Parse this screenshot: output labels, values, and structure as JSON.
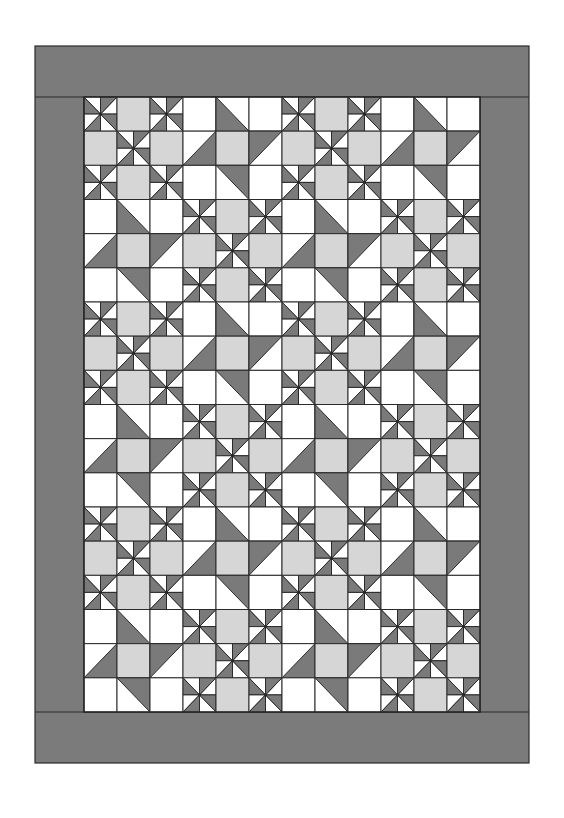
{
  "quilt": {
    "frame": {
      "x": 35,
      "y": 46,
      "width": 494,
      "height": 717
    },
    "interior": {
      "x": 84,
      "y": 97,
      "width": 396,
      "height": 615
    },
    "blocks_across": 4,
    "blocks_down": 6,
    "cells_per_block": 3,
    "block_arrangement": "checkerboard",
    "first_block": "pinwheel",
    "block_types": [
      "pinwheel",
      "star"
    ],
    "colors": {
      "border": "#7b7b7b",
      "dark": "#7a7a7a",
      "light_gray": "#d6d6d6",
      "white": "#ffffff",
      "line": "#2a2a2a",
      "background": "#ffffff"
    },
    "pinwheel_block": [
      [
        "pinwheel",
        "light",
        "pinwheel"
      ],
      [
        "light",
        "pinwheel",
        "light"
      ],
      [
        "pinwheel",
        "light",
        "pinwheel"
      ]
    ],
    "star_block": [
      [
        "white",
        "hst-dark-bl",
        "white"
      ],
      [
        "hst-dark-br",
        "light",
        "hst-dark-tl"
      ],
      [
        "white",
        "hst-dark-tr",
        "white"
      ]
    ]
  }
}
